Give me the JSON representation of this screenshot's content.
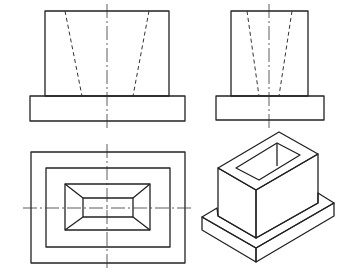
{
  "drawing": {
    "type": "orthographic-projection-with-isometric",
    "views": [
      "front",
      "side",
      "top",
      "isometric"
    ],
    "subject": "rectangular hollow block with tapered hole on rectangular base plate",
    "colors": {
      "line": "#222222",
      "background": "#ffffff"
    }
  },
  "front_view": {
    "body": [
      45,
      11,
      169,
      96
    ],
    "base": [
      30,
      96,
      185,
      121
    ],
    "hidden_lines": [
      [
        65,
        11,
        82,
        96
      ],
      [
        149,
        11,
        133,
        96
      ]
    ],
    "center_line": [
      107,
      5,
      107,
      127
    ]
  },
  "side_view": {
    "body": [
      231,
      11,
      308,
      96
    ],
    "base": [
      216,
      96,
      324,
      120
    ],
    "hidden_lines": [
      [
        247,
        11,
        259,
        96
      ],
      [
        292,
        11,
        279,
        96
      ]
    ],
    "center_line": [
      269,
      5,
      269,
      127
    ]
  },
  "top_view": {
    "rects": [
      [
        31,
        152,
        185,
        263
      ],
      [
        46,
        168,
        170,
        247
      ],
      [
        65,
        184,
        150,
        230
      ],
      [
        83,
        198,
        133,
        217
      ]
    ],
    "center_lines": [
      [
        107,
        144,
        107,
        271
      ],
      [
        23,
        208,
        193,
        208
      ]
    ]
  }
}
